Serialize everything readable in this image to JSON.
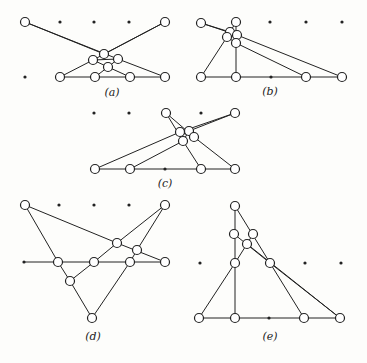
{
  "figure": {
    "panels": [
      {
        "label": "(a)",
        "label_pos": [
          112,
          86
        ],
        "dots": [
          [
            60,
            22
          ],
          [
            94,
            22
          ],
          [
            129,
            22
          ],
          [
            25,
            77
          ]
        ],
        "nodes": [
          [
            25,
            22
          ],
          [
            165,
            22
          ],
          [
            104,
            54
          ],
          [
            93,
            60
          ],
          [
            118,
            59
          ],
          [
            108,
            67
          ],
          [
            60,
            77
          ],
          [
            95,
            77
          ],
          [
            130,
            77
          ],
          [
            165,
            77
          ]
        ],
        "edges": [
          [
            [
              25,
              22
            ],
            [
              118,
              59
            ]
          ],
          [
            [
              25,
              22
            ],
            [
              104,
              54
            ]
          ],
          [
            [
              165,
              22
            ],
            [
              93,
              60
            ]
          ],
          [
            [
              165,
              22
            ],
            [
              104,
              54
            ]
          ],
          [
            [
              93,
              60
            ],
            [
              118,
              59
            ]
          ],
          [
            [
              93,
              60
            ],
            [
              60,
              77
            ]
          ],
          [
            [
              118,
              59
            ],
            [
              165,
              77
            ]
          ],
          [
            [
              93,
              60
            ],
            [
              108,
              67
            ]
          ],
          [
            [
              118,
              59
            ],
            [
              108,
              67
            ]
          ],
          [
            [
              108,
              67
            ],
            [
              95,
              77
            ]
          ],
          [
            [
              108,
              67
            ],
            [
              130,
              77
            ]
          ],
          [
            [
              60,
              77
            ],
            [
              165,
              77
            ]
          ]
        ]
      },
      {
        "label": "(b)",
        "label_pos": [
          270,
          85
        ],
        "dots": [
          [
            270,
            22
          ],
          [
            306,
            22
          ],
          [
            342,
            22
          ],
          [
            271,
            77
          ]
        ],
        "nodes": [
          [
            201,
            23
          ],
          [
            236,
            22
          ],
          [
            230,
            32
          ],
          [
            237,
            35
          ],
          [
            227,
            37
          ],
          [
            236,
            43
          ],
          [
            201,
            77
          ],
          [
            236,
            77
          ],
          [
            306,
            77
          ],
          [
            342,
            77
          ]
        ],
        "edges": [
          [
            [
              201,
              23
            ],
            [
              237,
              35
            ]
          ],
          [
            [
              201,
              23
            ],
            [
              230,
              32
            ]
          ],
          [
            [
              236,
              22
            ],
            [
              227,
              37
            ]
          ],
          [
            [
              236,
              22
            ],
            [
              236,
              43
            ]
          ],
          [
            [
              227,
              37
            ],
            [
              201,
              77
            ]
          ],
          [
            [
              236,
              43
            ],
            [
              236,
              77
            ]
          ],
          [
            [
              237,
              35
            ],
            [
              342,
              77
            ]
          ],
          [
            [
              236,
              43
            ],
            [
              306,
              77
            ]
          ],
          [
            [
              230,
              32
            ],
            [
              237,
              35
            ]
          ],
          [
            [
              227,
              37
            ],
            [
              236,
              43
            ]
          ],
          [
            [
              201,
              77
            ],
            [
              342,
              77
            ]
          ]
        ]
      },
      {
        "label": "(c)",
        "label_pos": [
          165,
          177
        ],
        "dots": [
          [
            94,
            113
          ],
          [
            129,
            113
          ],
          [
            201,
            113
          ],
          [
            165,
            169
          ]
        ],
        "nodes": [
          [
            166,
            113
          ],
          [
            235,
            113
          ],
          [
            180,
            132
          ],
          [
            189,
            131
          ],
          [
            194,
            137
          ],
          [
            183,
            141
          ],
          [
            95,
            169
          ],
          [
            130,
            169
          ],
          [
            201,
            169
          ],
          [
            235,
            169
          ]
        ],
        "edges": [
          [
            [
              166,
              113
            ],
            [
              183,
              141
            ]
          ],
          [
            [
              166,
              113
            ],
            [
              194,
              137
            ]
          ],
          [
            [
              235,
              113
            ],
            [
              180,
              132
            ]
          ],
          [
            [
              235,
              113
            ],
            [
              189,
              131
            ]
          ],
          [
            [
              180,
              132
            ],
            [
              95,
              169
            ]
          ],
          [
            [
              183,
              141
            ],
            [
              130,
              169
            ]
          ],
          [
            [
              183,
              141
            ],
            [
              201,
              169
            ]
          ],
          [
            [
              194,
              137
            ],
            [
              235,
              169
            ]
          ],
          [
            [
              180,
              132
            ],
            [
              194,
              137
            ]
          ],
          [
            [
              189,
              131
            ],
            [
              183,
              141
            ]
          ],
          [
            [
              95,
              169
            ],
            [
              235,
              169
            ]
          ]
        ]
      },
      {
        "label": "(d)",
        "label_pos": [
          93,
          330
        ],
        "dots": [
          [
            59,
            205
          ],
          [
            94,
            205
          ],
          [
            129,
            205
          ],
          [
            24,
            262
          ]
        ],
        "nodes": [
          [
            25,
            205
          ],
          [
            165,
            205
          ],
          [
            117,
            243
          ],
          [
            137,
            250
          ],
          [
            58,
            262
          ],
          [
            94,
            262
          ],
          [
            130,
            262
          ],
          [
            165,
            262
          ],
          [
            70,
            281
          ],
          [
            92,
            318
          ]
        ],
        "edges": [
          [
            [
              25,
              205
            ],
            [
              58,
              262
            ]
          ],
          [
            [
              25,
              205
            ],
            [
              117,
              243
            ]
          ],
          [
            [
              117,
              243
            ],
            [
              165,
              262
            ]
          ],
          [
            [
              165,
              205
            ],
            [
              117,
              243
            ]
          ],
          [
            [
              165,
              205
            ],
            [
              137,
              250
            ]
          ],
          [
            [
              117,
              243
            ],
            [
              94,
              262
            ]
          ],
          [
            [
              94,
              262
            ],
            [
              70,
              281
            ]
          ],
          [
            [
              58,
              262
            ],
            [
              70,
              281
            ]
          ],
          [
            [
              70,
              281
            ],
            [
              92,
              318
            ]
          ],
          [
            [
              137,
              250
            ],
            [
              130,
              262
            ]
          ],
          [
            [
              130,
              262
            ],
            [
              92,
              318
            ]
          ],
          [
            [
              24,
              262
            ],
            [
              165,
              262
            ]
          ]
        ]
      },
      {
        "label": "(e)",
        "label_pos": [
          270,
          330
        ],
        "dots": [
          [
            200,
            263
          ],
          [
            305,
            263
          ],
          [
            341,
            263
          ],
          [
            269,
            318
          ]
        ],
        "nodes": [
          [
            235,
            206
          ],
          [
            234,
            234
          ],
          [
            253,
            234
          ],
          [
            247,
            244
          ],
          [
            235,
            263
          ],
          [
            270,
            263
          ],
          [
            199,
            318
          ],
          [
            235,
            318
          ],
          [
            304,
            318
          ],
          [
            340,
            318
          ]
        ],
        "edges": [
          [
            [
              235,
              206
            ],
            [
              235,
              318
            ]
          ],
          [
            [
              235,
              206
            ],
            [
              270,
              263
            ]
          ],
          [
            [
              234,
              234
            ],
            [
              270,
              263
            ]
          ],
          [
            [
              253,
              234
            ],
            [
              247,
              244
            ]
          ],
          [
            [
              247,
              244
            ],
            [
              235,
              263
            ]
          ],
          [
            [
              235,
              263
            ],
            [
              199,
              318
            ]
          ],
          [
            [
              270,
              263
            ],
            [
              304,
              318
            ]
          ],
          [
            [
              247,
              244
            ],
            [
              340,
              318
            ]
          ],
          [
            [
              270,
              263
            ],
            [
              340,
              318
            ]
          ],
          [
            [
              199,
              318
            ],
            [
              340,
              318
            ]
          ]
        ]
      }
    ],
    "style": {
      "stroke": "#222222",
      "node_fill": "#ffffff",
      "node_r": 4.5,
      "dot_r": 1.6
    }
  }
}
